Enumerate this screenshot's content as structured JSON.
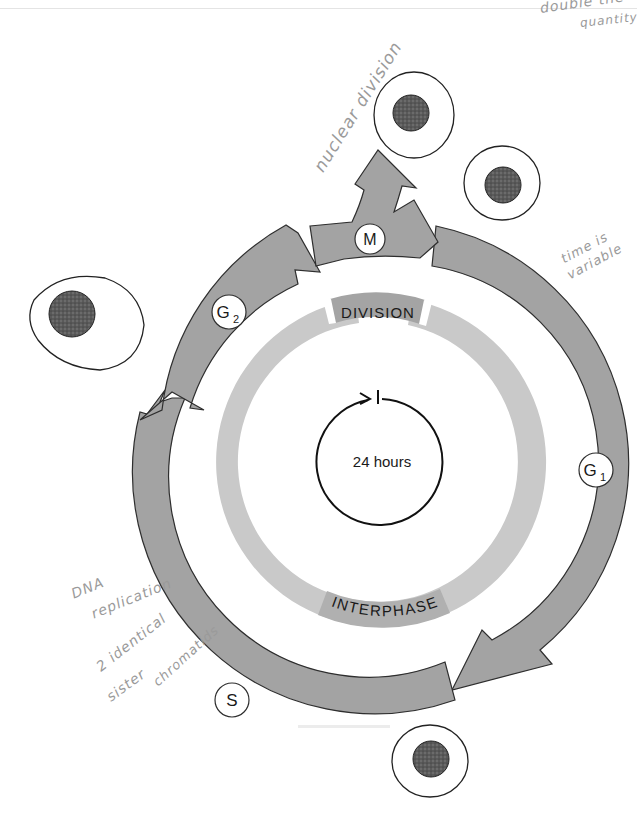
{
  "diagram": {
    "center_label": "24 hours",
    "inner_ring": {
      "top_label": "DIVISION",
      "bottom_label": "INTERPHASE"
    },
    "phases": [
      {
        "id": "M",
        "label": "M",
        "subscript": ""
      },
      {
        "id": "G1",
        "label": "G",
        "subscript": "1"
      },
      {
        "id": "S",
        "label": "S",
        "subscript": ""
      },
      {
        "id": "G2",
        "label": "G",
        "subscript": "2"
      }
    ],
    "colors": {
      "arrow_fill": "#a3a3a3",
      "arrow_stroke": "#2e2e2e",
      "inner_ring": "#c8c8c8",
      "label_bg": "#9e9e9e",
      "nucleus": "#555555",
      "handwriting": "#9a9a9a"
    }
  },
  "annotations": {
    "top_right_line1": "double the",
    "top_right_line2": "quantity",
    "nuclear_division": "nuclear division",
    "time_is_variable_line1": "time is",
    "time_is_variable_line2": "variable",
    "dna_replication_line1": "DNA",
    "dna_replication_line2": "replication",
    "sister_line1": "2 identical",
    "sister_line2": "sister",
    "sister_line3": "chromatids"
  }
}
